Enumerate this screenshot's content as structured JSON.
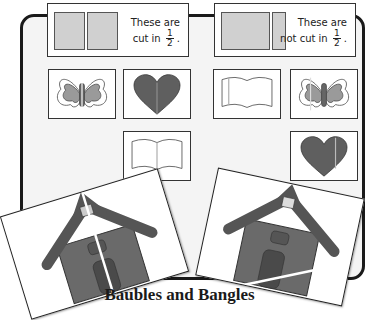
{
  "poster": {
    "title": "Baubles and Bangles"
  },
  "header_cards": [
    {
      "label_line1": "These are",
      "label_line2": "cut in",
      "fraction_num": "1",
      "fraction_den": "2",
      "trailing": ".",
      "swatch": "equal-halves"
    },
    {
      "label_line1": "These are",
      "label_line2": "not cut in",
      "fraction_num": "1",
      "fraction_den": "2",
      "trailing": ".",
      "swatch": "unequal-parts"
    }
  ],
  "tiles": [
    {
      "icon": "butterfly-icon",
      "cut": "half"
    },
    {
      "icon": "heart-icon",
      "cut": "half"
    },
    {
      "icon": "book-icon",
      "cut": "half"
    },
    {
      "icon": "book-icon",
      "cut": "not-half"
    },
    {
      "icon": "butterfly-icon",
      "cut": "not-half"
    },
    {
      "icon": "heart-icon",
      "cut": "not-half"
    }
  ],
  "photos": [
    {
      "icon": "schoolhouse-icon",
      "cut": "half"
    },
    {
      "icon": "schoolhouse-icon",
      "cut": "not-half"
    }
  ],
  "colors": {
    "swatch_fill": "#d0d0d0",
    "shape_dark": "#5a5a5a",
    "shape_mid": "#8a8a8a",
    "board_border": "#1a1a1a"
  }
}
